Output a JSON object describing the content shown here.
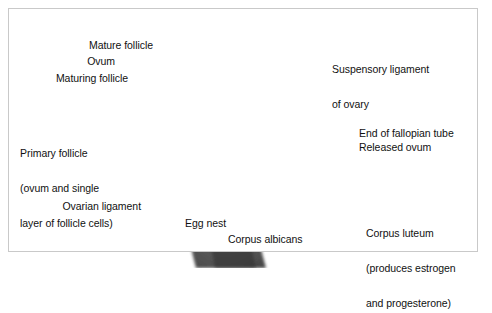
{
  "figure": {
    "background_color": "#ffffff",
    "frame_color": "#c9c9c9",
    "style": "grayscale medical illustration"
  },
  "labels": {
    "mature_follicle": "Mature follicle",
    "ovum": "Ovum",
    "maturing_follicle": "Maturing follicle",
    "primary_follicle_l1": "Primary follicle",
    "primary_follicle_l2": "(ovum and single",
    "primary_follicle_l3": "layer of follicle cells)",
    "ovarian_ligament": "Ovarian ligament",
    "egg_nest": "Egg nest",
    "corpus_albicans": "Corpus albicans",
    "suspensory_ligament_l1": "Suspensory ligament",
    "suspensory_ligament_l2": "of ovary",
    "end_of_fallopian_tube": "End of fallopian tube",
    "released_ovum": "Released ovum",
    "corpus_luteum_l1": "Corpus luteum",
    "corpus_luteum_l2": "(produces estrogen",
    "corpus_luteum_l3": "and progesterone)"
  },
  "anatomy": {
    "ovary_structures": [
      "primary follicle",
      "maturing follicle",
      "mature follicle",
      "ruptured follicle",
      "corpus luteum",
      "corpus albicans",
      "egg nest",
      "stroma"
    ],
    "leader_line_color": "#1a1a1a"
  }
}
